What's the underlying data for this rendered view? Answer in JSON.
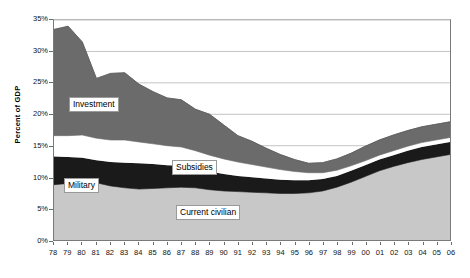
{
  "chart_data": {
    "type": "area",
    "title": "",
    "xlabel": "",
    "ylabel": "Percent of GDP",
    "ylim": [
      0,
      35
    ],
    "ytick_labels": [
      "0%",
      "5%",
      "10%",
      "15%",
      "20%",
      "25%",
      "30%",
      "35%"
    ],
    "ytick_values": [
      0,
      5,
      10,
      15,
      20,
      25,
      30,
      35
    ],
    "grid": true,
    "grid_axis": "y",
    "legend": "inline-labels",
    "stacked": true,
    "stack_order_bottom_to_top": [
      "Current civilian",
      "Military",
      "Subsidies",
      "Investment"
    ],
    "categories": [
      "78",
      "79",
      "80",
      "81",
      "82",
      "83",
      "84",
      "85",
      "86",
      "87",
      "88",
      "89",
      "90",
      "91",
      "92",
      "93",
      "94",
      "95",
      "96",
      "97",
      "98",
      "99",
      "00",
      "01",
      "02",
      "03",
      "04",
      "05",
      "06"
    ],
    "x": [
      1978,
      1979,
      1980,
      1981,
      1982,
      1983,
      1984,
      1985,
      1986,
      1987,
      1988,
      1989,
      1990,
      1991,
      1992,
      1993,
      1994,
      1995,
      1996,
      1997,
      1998,
      1999,
      2000,
      2001,
      2002,
      2003,
      2004,
      2005,
      2006
    ],
    "series": [
      {
        "name": "Current civilian",
        "color": "#c8c8c8",
        "values": [
          8.8,
          9.0,
          9.2,
          9.1,
          8.6,
          8.3,
          8.1,
          8.2,
          8.3,
          8.4,
          8.3,
          8.0,
          7.8,
          7.7,
          7.6,
          7.5,
          7.4,
          7.4,
          7.5,
          7.8,
          8.4,
          9.2,
          10.1,
          11.0,
          11.7,
          12.3,
          12.8,
          13.2,
          13.6
        ]
      },
      {
        "name": "Military",
        "color": "#1a1a1a",
        "values": [
          4.5,
          4.2,
          3.9,
          3.6,
          3.8,
          4.0,
          4.1,
          3.9,
          3.6,
          3.4,
          3.1,
          2.9,
          2.7,
          2.5,
          2.4,
          2.3,
          2.2,
          2.1,
          2.0,
          1.9,
          1.8,
          1.8,
          1.8,
          1.8,
          1.8,
          1.9,
          2.0,
          2.0,
          2.0
        ]
      },
      {
        "name": "Subsidies",
        "color": "#ffffff",
        "values": [
          3.3,
          3.4,
          3.6,
          3.5,
          3.5,
          3.6,
          3.4,
          3.2,
          3.1,
          3.0,
          2.8,
          2.6,
          2.4,
          2.2,
          2.0,
          1.8,
          1.6,
          1.4,
          1.2,
          1.0,
          0.9,
          0.8,
          0.7,
          0.7,
          0.7,
          0.7,
          0.7,
          0.7,
          0.7
        ]
      },
      {
        "name": "Investment",
        "color": "#6b6b6b",
        "values": [
          16.9,
          17.4,
          14.8,
          9.5,
          10.6,
          10.7,
          9.2,
          8.3,
          7.6,
          7.5,
          6.6,
          6.5,
          5.4,
          4.2,
          3.7,
          3.0,
          2.4,
          1.9,
          1.5,
          1.6,
          1.8,
          2.0,
          2.3,
          2.4,
          2.5,
          2.5,
          2.5,
          2.5,
          2.5
        ]
      }
    ],
    "cumulative_tops": {
      "Current civilian": [
        8.8,
        9.0,
        9.2,
        9.1,
        8.6,
        8.3,
        8.1,
        8.2,
        8.3,
        8.4,
        8.3,
        8.0,
        7.8,
        7.7,
        7.6,
        7.5,
        7.4,
        7.4,
        7.5,
        7.8,
        8.4,
        9.2,
        10.1,
        11.0,
        11.7,
        12.3,
        12.8,
        13.2,
        13.6
      ],
      "Military": [
        13.3,
        13.2,
        13.1,
        12.7,
        12.4,
        12.3,
        12.2,
        12.1,
        11.9,
        11.8,
        11.4,
        10.9,
        10.5,
        10.2,
        10.0,
        9.8,
        9.6,
        9.5,
        9.5,
        9.7,
        10.2,
        11.0,
        11.9,
        12.8,
        13.5,
        14.2,
        14.8,
        15.2,
        15.6
      ],
      "Subsidies": [
        16.6,
        16.6,
        16.7,
        16.2,
        15.9,
        15.9,
        15.6,
        15.3,
        15.0,
        14.8,
        14.2,
        13.5,
        12.9,
        12.4,
        12.0,
        11.6,
        11.2,
        10.9,
        10.7,
        10.7,
        11.1,
        11.8,
        12.6,
        13.5,
        14.2,
        14.9,
        15.5,
        15.9,
        16.3
      ],
      "Investment": [
        33.5,
        34.0,
        31.5,
        25.7,
        26.5,
        26.6,
        24.8,
        23.6,
        22.6,
        22.3,
        20.8,
        20.0,
        18.3,
        16.6,
        15.7,
        14.6,
        13.6,
        12.8,
        12.2,
        12.3,
        12.9,
        13.8,
        14.9,
        15.9,
        16.7,
        17.4,
        18.0,
        18.4,
        18.8
      ]
    },
    "annotations": [
      {
        "text": "Investment",
        "series": "Investment"
      },
      {
        "text": "Subsidies",
        "series": "Subsidies"
      },
      {
        "text": "Military",
        "series": "Military"
      },
      {
        "text": "Current civilian",
        "series": "Current civilian"
      }
    ]
  },
  "axis": {
    "y_title": "Percent of GDP"
  },
  "labels": {
    "investment": "Investment",
    "subsidies": "Subsidies",
    "military": "Military",
    "current_civilian": "Current civilian"
  }
}
